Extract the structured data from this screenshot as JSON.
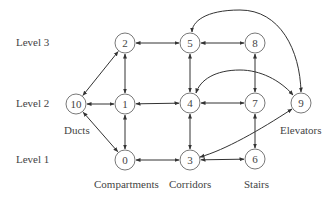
{
  "levels": [
    {
      "label": "Level 3",
      "y": 43
    },
    {
      "label": "Level 2",
      "y": 104
    },
    {
      "label": "Level 1",
      "y": 160
    }
  ],
  "nodes": [
    {
      "id": "0",
      "x": 125,
      "y": 160
    },
    {
      "id": "1",
      "x": 125,
      "y": 104
    },
    {
      "id": "2",
      "x": 125,
      "y": 43
    },
    {
      "id": "3",
      "x": 190,
      "y": 160
    },
    {
      "id": "4",
      "x": 190,
      "y": 103
    },
    {
      "id": "5",
      "x": 190,
      "y": 43
    },
    {
      "id": "6",
      "x": 255,
      "y": 159
    },
    {
      "id": "7",
      "x": 255,
      "y": 103
    },
    {
      "id": "8",
      "x": 255,
      "y": 43
    },
    {
      "id": "9",
      "x": 301,
      "y": 103
    },
    {
      "id": "10",
      "x": 76,
      "y": 104
    }
  ],
  "categories": [
    {
      "label": "Ducts",
      "x": 76,
      "y": 130
    },
    {
      "label": "Compartments",
      "x": 125,
      "y": 184
    },
    {
      "label": "Corridors",
      "x": 190,
      "y": 184
    },
    {
      "label": "Stairs",
      "x": 258,
      "y": 184
    },
    {
      "label": "Elevators",
      "x": 301,
      "y": 130
    }
  ],
  "edges": [
    {
      "from": "2",
      "to": "5",
      "type": "bidirectional"
    },
    {
      "from": "5",
      "to": "8",
      "type": "bidirectional"
    },
    {
      "from": "2",
      "to": "1",
      "type": "bidirectional"
    },
    {
      "from": "10",
      "to": "2",
      "type": "bidirectional"
    },
    {
      "from": "10",
      "to": "1",
      "type": "bidirectional"
    },
    {
      "from": "10",
      "to": "0",
      "type": "bidirectional"
    },
    {
      "from": "1",
      "to": "4",
      "type": "bidirectional"
    },
    {
      "from": "4",
      "to": "7",
      "type": "bidirectional"
    },
    {
      "from": "5",
      "to": "4",
      "type": "bidirectional"
    },
    {
      "from": "8",
      "to": "7",
      "type": "bidirectional"
    },
    {
      "from": "1",
      "to": "0",
      "type": "bidirectional"
    },
    {
      "from": "4",
      "to": "3",
      "type": "bidirectional"
    },
    {
      "from": "7",
      "to": "6",
      "type": "bidirectional"
    },
    {
      "from": "0",
      "to": "3",
      "type": "bidirectional"
    },
    {
      "from": "3",
      "to": "6",
      "type": "bidirectional"
    },
    {
      "from": "5",
      "to": "9",
      "type": "bidirectional-curved"
    },
    {
      "from": "4",
      "to": "9",
      "type": "bidirectional-curved"
    },
    {
      "from": "3",
      "to": "9",
      "type": "bidirectional-curved"
    }
  ],
  "colors": {
    "stroke": "#333333",
    "text": "#444444"
  }
}
